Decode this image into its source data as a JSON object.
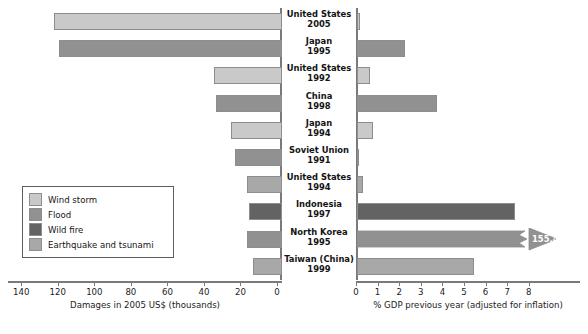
{
  "chart_data": {
    "type": "bar",
    "title": "",
    "orientation": "horizontal-diverging",
    "categories": [
      {
        "country": "United States",
        "year": "2005"
      },
      {
        "country": "Japan",
        "year": "1995"
      },
      {
        "country": "United States",
        "year": "1992"
      },
      {
        "country": "China",
        "year": "1998"
      },
      {
        "country": "Japan",
        "year": "1994"
      },
      {
        "country": "Soviet Union",
        "year": "1991"
      },
      {
        "country": "United States",
        "year": "1994"
      },
      {
        "country": "Indonesia",
        "year": "1997"
      },
      {
        "country": "North Korea",
        "year": "1995"
      },
      {
        "country": "Taiwan (China)",
        "year": "1999"
      }
    ],
    "disaster_types": [
      "Wind storm",
      "Flood",
      "Wind storm",
      "Flood",
      "Wind storm",
      "Flood",
      "Earthquake and tsunami",
      "Wild fire",
      "Flood",
      "Earthquake and tsunami"
    ],
    "left": {
      "name": "Damages in 2005 US$ (thousands)",
      "xlabel": "Damages in 2005 US$ (thousands)",
      "ticks": [
        140,
        120,
        100,
        80,
        60,
        40,
        20,
        0
      ],
      "xlim": [
        150,
        0
      ],
      "direction": "right-to-left",
      "values": [
        125,
        122,
        37,
        36,
        28,
        26,
        19,
        18,
        19,
        16
      ]
    },
    "right": {
      "name": "% GDP previous year (adjusted for inflation)",
      "xlabel": "% GDP previous year (adjusted for inflation)",
      "ticks": [
        0,
        1,
        2,
        3,
        4,
        5,
        6,
        7,
        8
      ],
      "xlim": [
        0,
        9
      ],
      "direction": "left-to-right",
      "values": [
        0.15,
        2.2,
        0.6,
        3.7,
        0.75,
        0.05,
        0.3,
        7.3,
        155.4,
        5.4
      ],
      "broken_bar_index": 8,
      "broken_bar_label": "155.4"
    },
    "legend": {
      "position": "lower-left",
      "entries": [
        {
          "label": "Wind storm",
          "color": "#c9c9c9"
        },
        {
          "label": "Flood",
          "color": "#919191"
        },
        {
          "label": "Wild fire",
          "color": "#636363"
        },
        {
          "label": "Earthquake and tsunami",
          "color": "#a8a8a8"
        }
      ]
    },
    "colors": {
      "wind_storm": "#c9c9c9",
      "flood": "#919191",
      "wild_fire": "#636363",
      "earthquake_and_tsunami": "#a8a8a8",
      "axis": "#7a7a7a",
      "text": "#141414",
      "background": "#ffffff"
    }
  }
}
